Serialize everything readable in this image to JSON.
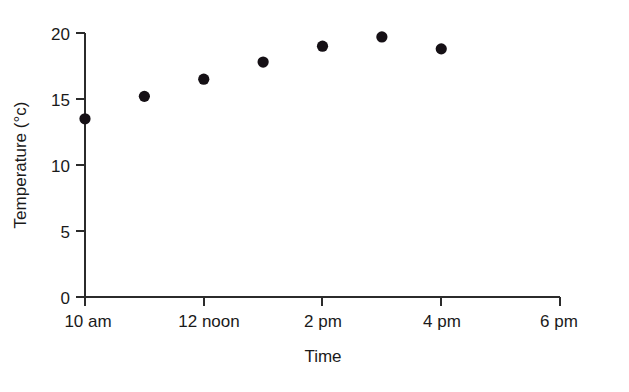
{
  "chart_data": {
    "type": "scatter",
    "title": "",
    "xlabel": "Time",
    "ylabel": "Temperature (°c)",
    "x_tick_labels": [
      "10 am",
      "12 noon",
      "2 pm",
      "4 pm",
      "6 pm"
    ],
    "x_tick_hours": [
      10,
      12,
      14,
      16,
      18
    ],
    "y_tick_labels": [
      "0",
      "5",
      "10",
      "15",
      "20"
    ],
    "y_tick_values": [
      0,
      5,
      10,
      15,
      20
    ],
    "xlim": [
      10,
      18
    ],
    "ylim": [
      0,
      20
    ],
    "grid": false,
    "legend": false,
    "marker": "filled-circle",
    "marker_color": "#151015",
    "axis_color": "#2b2b2b",
    "points": [
      {
        "x_hour": 10,
        "x_label": "10 am",
        "y": 13.5
      },
      {
        "x_hour": 11,
        "x_label": "11 am",
        "y": 15.2
      },
      {
        "x_hour": 12,
        "x_label": "12 noon",
        "y": 16.5
      },
      {
        "x_hour": 13,
        "x_label": "1 pm",
        "y": 17.8
      },
      {
        "x_hour": 14,
        "x_label": "2 pm",
        "y": 19.0
      },
      {
        "x_hour": 15,
        "x_label": "3 pm",
        "y": 19.7
      },
      {
        "x_hour": 16,
        "x_label": "4 pm",
        "y": 18.8
      }
    ],
    "x": [
      10,
      11,
      12,
      13,
      14,
      15,
      16
    ],
    "values": [
      13.5,
      15.2,
      16.5,
      17.8,
      19.0,
      19.7,
      18.8
    ]
  }
}
